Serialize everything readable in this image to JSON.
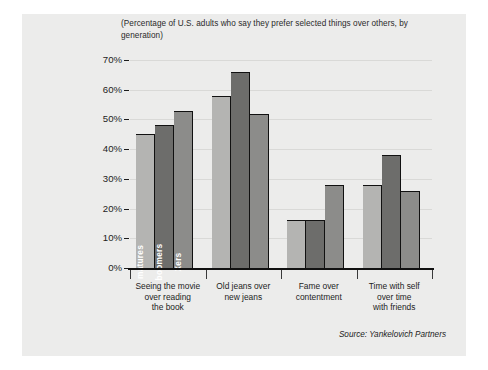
{
  "figure": {
    "background_color": "#ffffff",
    "panel_color": "#ececeb",
    "title_line_1": "(Percentage of U.S. adults who say they prefer selected things over others, by",
    "title_line_2": "generation)",
    "source": "Source: Yankelovich Partners"
  },
  "chart_data": {
    "type": "bar",
    "title": "(Percentage of U.S. adults who say they prefer selected things over others, by generation)",
    "xlabel": "",
    "ylabel": "",
    "ylim": [
      0,
      70
    ],
    "ytick_labels": [
      "70%",
      "60%",
      "50%",
      "40%",
      "30%",
      "20%",
      "10%",
      "0%"
    ],
    "ytick_values": [
      70,
      60,
      50,
      40,
      30,
      20,
      10,
      0
    ],
    "grid": true,
    "legend_position": "in-bar-rotated-labels",
    "categories": [
      "Seeing the movie over reading the book",
      "Old jeans over new jeans",
      "Fame over contentment",
      "Time with self over time with friends"
    ],
    "category_lines": [
      [
        "Seeing the movie",
        "over reading",
        "the book"
      ],
      [
        "Old jeans over",
        "new jeans"
      ],
      [
        "Fame over",
        "contentment"
      ],
      [
        "Time with self",
        "over time",
        "with friends"
      ]
    ],
    "series": [
      {
        "name": "matures",
        "color": "#b4b4b2",
        "values": [
          45,
          58,
          16,
          28
        ]
      },
      {
        "name": "boomers",
        "color": "#6d6d6b",
        "values": [
          48,
          66,
          16,
          38
        ]
      },
      {
        "name": "Xers",
        "color": "#8c8c8a",
        "values": [
          53,
          52,
          28,
          26
        ]
      }
    ],
    "source": "Source: Yankelovich Partners"
  }
}
